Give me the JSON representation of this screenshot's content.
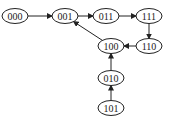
{
  "diagram": {
    "type": "state-transition-graph",
    "nodes": [
      {
        "id": "000",
        "label": "000",
        "x": 15,
        "y": 16
      },
      {
        "id": "001",
        "label": "001",
        "x": 65,
        "y": 16
      },
      {
        "id": "011",
        "label": "011",
        "x": 106,
        "y": 16
      },
      {
        "id": "111",
        "label": "111",
        "x": 149,
        "y": 16
      },
      {
        "id": "110",
        "label": "110",
        "x": 149,
        "y": 46
      },
      {
        "id": "100",
        "label": "100",
        "x": 111,
        "y": 46
      },
      {
        "id": "010",
        "label": "010",
        "x": 111,
        "y": 78
      },
      {
        "id": "101",
        "label": "101",
        "x": 111,
        "y": 108
      }
    ],
    "edges": [
      {
        "from": "000",
        "to": "001"
      },
      {
        "from": "001",
        "to": "011"
      },
      {
        "from": "011",
        "to": "111"
      },
      {
        "from": "111",
        "to": "110"
      },
      {
        "from": "110",
        "to": "100"
      },
      {
        "from": "100",
        "to": "001"
      },
      {
        "from": "010",
        "to": "100"
      },
      {
        "from": "101",
        "to": "010"
      }
    ]
  }
}
